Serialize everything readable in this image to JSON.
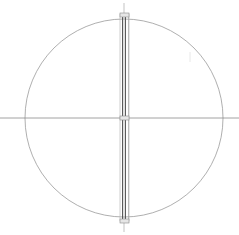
{
  "drawing": {
    "background": "#ffffff",
    "stroke_color": "#8a8a8a",
    "dark_stroke_color": "#4a4a4a",
    "circle": {
      "cx": 124,
      "cy": 118,
      "r": 99
    },
    "horizontal_axis": {
      "y": 118,
      "x1": 0,
      "x2": 239
    },
    "vertical_axis": {
      "x": 124,
      "y1": 3,
      "y2": 232
    },
    "shaft": {
      "x": 121,
      "width": 8,
      "y1": 15,
      "y2": 221
    },
    "nodes": [
      {
        "name": "top-node",
        "x": 124,
        "y": 15
      },
      {
        "name": "center-node",
        "x": 124,
        "y": 118
      },
      {
        "name": "bottom-node",
        "x": 124,
        "y": 221
      }
    ]
  },
  "footer": {
    "text": ""
  }
}
